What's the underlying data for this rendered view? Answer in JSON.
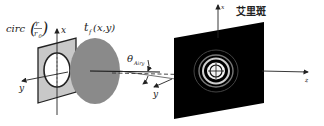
{
  "diagram": {
    "aperture": {
      "label_func": "circ",
      "label_num": "r",
      "label_den": "r",
      "label_den_sub": "0",
      "fill": "#c8c8c8"
    },
    "lens": {
      "label": "t",
      "label_sub": "f",
      "label_args": "(x,y)",
      "fill": "#8a8a8a"
    },
    "angle": {
      "label": "θ",
      "label_sub": "Airy"
    },
    "screen": {
      "title": "艾里斑",
      "fill": "#000000"
    },
    "axes": {
      "left_x": "x",
      "left_y": "y",
      "mid_y": "y",
      "right_x": "x",
      "right_z": "z"
    }
  }
}
